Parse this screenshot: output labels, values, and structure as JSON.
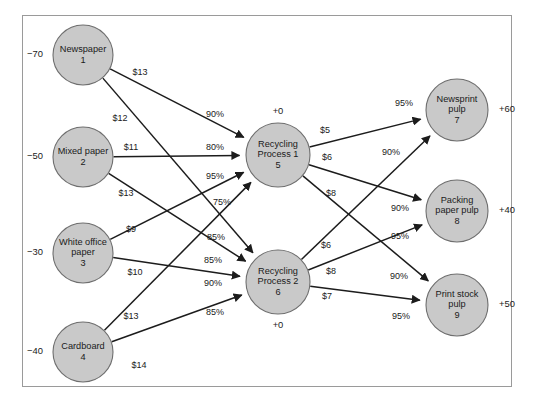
{
  "diagram": {
    "type": "minimum-cost-network-flow",
    "nodes": [
      {
        "id": 1,
        "name": "Newspaper",
        "number": "1",
        "lines": [
          "Newspaper",
          "1"
        ],
        "supply": "−70",
        "supply_side": "left",
        "cx": 83,
        "cy": 55,
        "r": 30
      },
      {
        "id": 2,
        "name": "Mixed paper",
        "number": "2",
        "lines": [
          "Mixed paper",
          "2"
        ],
        "supply": "−50",
        "supply_side": "left",
        "cx": 83,
        "cy": 157,
        "r": 30
      },
      {
        "id": 3,
        "name": "White office paper",
        "number": "3",
        "lines": [
          "White office",
          "paper",
          "3"
        ],
        "supply": "−30",
        "supply_side": "left",
        "cx": 83,
        "cy": 253,
        "r": 30
      },
      {
        "id": 4,
        "name": "Cardboard",
        "number": "4",
        "lines": [
          "Cardboard",
          "4"
        ],
        "supply": "−40",
        "supply_side": "left",
        "cx": 83,
        "cy": 352,
        "r": 30
      },
      {
        "id": 5,
        "name": "Recycling Process 1",
        "number": "5",
        "lines": [
          "Recycling",
          "Process 1",
          "5"
        ],
        "supply": "+0",
        "supply_side": "top",
        "cx": 278,
        "cy": 155,
        "r": 32
      },
      {
        "id": 6,
        "name": "Recycling Process 2",
        "number": "6",
        "lines": [
          "Recycling",
          "Process 2",
          "6"
        ],
        "supply": "+0",
        "supply_side": "bottom",
        "cx": 278,
        "cy": 282,
        "r": 32
      },
      {
        "id": 7,
        "name": "Newsprint pulp",
        "number": "7",
        "lines": [
          "Newsprint",
          "pulp",
          "7"
        ],
        "supply": "+60",
        "supply_side": "right",
        "cx": 457,
        "cy": 110,
        "r": 31
      },
      {
        "id": 8,
        "name": "Packing paper pulp",
        "number": "8",
        "lines": [
          "Packing",
          "paper pulp",
          "8"
        ],
        "supply": "+40",
        "supply_side": "right",
        "cx": 457,
        "cy": 211,
        "r": 31
      },
      {
        "id": 9,
        "name": "Print stock pulp",
        "number": "9",
        "lines": [
          "Print stock",
          "pulp",
          "9"
        ],
        "supply": "+50",
        "supply_side": "right",
        "cx": 457,
        "cy": 305,
        "r": 31
      }
    ],
    "arcs": [
      {
        "from": 1,
        "to": 5,
        "cost": "$13",
        "yield": "90%",
        "cost_x": 140,
        "cost_y": 73,
        "yield_x": 215,
        "yield_y": 115
      },
      {
        "from": 1,
        "to": 6,
        "cost": "$12",
        "yield": "85%",
        "cost_x": 120,
        "cost_y": 119,
        "yield_x": 216,
        "yield_y": 238
      },
      {
        "from": 2,
        "to": 5,
        "cost": "$11",
        "yield": "80%",
        "cost_x": 131,
        "cost_y": 148,
        "yield_x": 215,
        "yield_y": 148
      },
      {
        "from": 2,
        "to": 6,
        "cost": "$13",
        "yield": "85%",
        "cost_x": 126,
        "cost_y": 194,
        "yield_x": 213,
        "yield_y": 261
      },
      {
        "from": 3,
        "to": 5,
        "cost": "$9",
        "yield": "95%",
        "cost_x": 131,
        "cost_y": 230,
        "yield_x": 215,
        "yield_y": 177
      },
      {
        "from": 3,
        "to": 6,
        "cost": "$10",
        "yield": "90%",
        "cost_x": 135,
        "cost_y": 273,
        "yield_x": 213,
        "yield_y": 284
      },
      {
        "from": 4,
        "to": 5,
        "cost": "$13",
        "yield": "75%",
        "cost_x": 131,
        "cost_y": 317,
        "yield_x": 222,
        "yield_y": 203
      },
      {
        "from": 4,
        "to": 6,
        "cost": "$14",
        "yield": "85%",
        "cost_x": 139,
        "cost_y": 366,
        "yield_x": 215,
        "yield_y": 313
      },
      {
        "from": 5,
        "to": 7,
        "cost": "$5",
        "yield": "95%",
        "cost_x": 325,
        "cost_y": 131,
        "yield_x": 404,
        "yield_y": 104
      },
      {
        "from": 5,
        "to": 8,
        "cost": "$6",
        "yield": "90%",
        "cost_x": 327,
        "cost_y": 158,
        "yield_x": 400,
        "yield_y": 209
      },
      {
        "from": 5,
        "to": 9,
        "cost": "$8",
        "yield": "90%",
        "cost_x": 331,
        "cost_y": 194,
        "yield_x": 399,
        "yield_y": 277
      },
      {
        "from": 6,
        "to": 7,
        "cost": "$6",
        "yield": "90%",
        "cost_x": 326,
        "cost_y": 246,
        "yield_x": 391,
        "yield_y": 153
      },
      {
        "from": 6,
        "to": 8,
        "cost": "$8",
        "yield": "95%",
        "cost_x": 331,
        "cost_y": 272,
        "yield_x": 400,
        "yield_y": 237
      },
      {
        "from": 6,
        "to": 9,
        "cost": "$7",
        "yield": "95%",
        "cost_x": 327,
        "cost_y": 297,
        "yield_x": 401,
        "yield_y": 317
      }
    ]
  }
}
